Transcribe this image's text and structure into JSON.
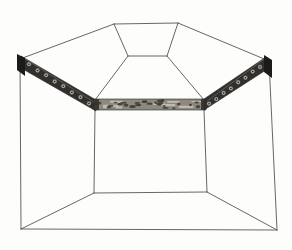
{
  "figure": {
    "canvas": {
      "width": 292,
      "height": 250
    },
    "colors": {
      "background": "#fdfdfb",
      "line": "#565656",
      "frieze_dark": "#32302c",
      "frieze_end_cap": "#1d1b19",
      "frieze_mid_base": "#8d8981",
      "rosette_fill": "#a9a59d",
      "rosette_dot": "#181613",
      "speck_dark": "#3b3833",
      "speck_light": "#cfcbc2",
      "band_highlight": "#bdb9b0"
    },
    "lines": [
      {
        "name": "outer-top-edge",
        "x1": 114,
        "y1": 24,
        "x2": 178,
        "y2": 23
      },
      {
        "name": "outer-slope-left",
        "x1": 20,
        "y1": 59,
        "x2": 114,
        "y2": 24
      },
      {
        "name": "outer-slope-right",
        "x1": 178,
        "y1": 23,
        "x2": 269,
        "y2": 61
      },
      {
        "name": "outer-edge-left",
        "x1": 20,
        "y1": 59,
        "x2": 21,
        "y2": 229
      },
      {
        "name": "outer-edge-right",
        "x1": 269,
        "y1": 61,
        "x2": 277,
        "y2": 230
      },
      {
        "name": "outer-bottom-edge",
        "x1": 21,
        "y1": 229,
        "x2": 277,
        "y2": 230
      },
      {
        "name": "ceiling-panel-left",
        "x1": 114,
        "y1": 24,
        "x2": 128,
        "y2": 56
      },
      {
        "name": "ceiling-panel-right",
        "x1": 178,
        "y1": 23,
        "x2": 167,
        "y2": 56
      },
      {
        "name": "ceiling-panel-bottom",
        "x1": 128,
        "y1": 56,
        "x2": 167,
        "y2": 56
      },
      {
        "name": "ceiling-hip-left",
        "x1": 128,
        "y1": 56,
        "x2": 95,
        "y2": 100
      },
      {
        "name": "ceiling-hip-right",
        "x1": 167,
        "y1": 56,
        "x2": 204,
        "y2": 100
      },
      {
        "name": "wall-corner-left",
        "x1": 95,
        "y1": 110,
        "x2": 94,
        "y2": 193
      },
      {
        "name": "wall-corner-right",
        "x1": 204,
        "y1": 110,
        "x2": 207,
        "y2": 192
      },
      {
        "name": "back-wall-floor-edge",
        "x1": 94,
        "y1": 193,
        "x2": 207,
        "y2": 192
      },
      {
        "name": "floor-diagonal-left",
        "x1": 21,
        "y1": 229,
        "x2": 94,
        "y2": 193
      },
      {
        "name": "floor-diagonal-right",
        "x1": 277,
        "y1": 230,
        "x2": 207,
        "y2": 192
      }
    ],
    "bands": [
      {
        "name": "left-frieze-band",
        "type": "rosette",
        "points": [
          [
            21,
            56
          ],
          [
            96,
            100
          ],
          [
            96,
            111
          ],
          [
            21,
            68
          ]
        ],
        "rosettes": {
          "count": 8,
          "from": [
            29,
            64.5
          ],
          "to": [
            89,
            103
          ],
          "radius": 2.4
        },
        "end_cap": [
          [
            17,
            54
          ],
          [
            25,
            58
          ],
          [
            25,
            76
          ],
          [
            17,
            70
          ]
        ]
      },
      {
        "name": "middle-frieze-band",
        "type": "mottled",
        "points": [
          [
            94,
            99
          ],
          [
            206,
            99
          ],
          [
            206,
            110
          ],
          [
            94,
            110
          ]
        ]
      },
      {
        "name": "right-frieze-band",
        "type": "rosette",
        "points": [
          [
            204,
            99
          ],
          [
            266,
            57
          ],
          [
            266,
            70
          ],
          [
            204,
            110
          ]
        ],
        "rosettes": {
          "count": 8,
          "from": [
            209,
            104
          ],
          "to": [
            260,
            66.5
          ],
          "radius": 2.4
        },
        "end_cap": [
          [
            264,
            55
          ],
          [
            272,
            60
          ],
          [
            272,
            78
          ],
          [
            264,
            72
          ]
        ]
      }
    ],
    "texture": {
      "seed": 7,
      "dark_specks": 28,
      "light_streaks": 9
    }
  }
}
